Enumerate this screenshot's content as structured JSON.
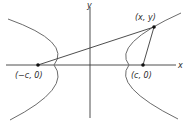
{
  "diagram": {
    "type": "hyperbola-foci",
    "axes": {
      "x_label": "x",
      "y_label": "y"
    },
    "points": {
      "left_focus": {
        "label": "(−c, 0)"
      },
      "right_focus": {
        "label": "(c, 0)"
      },
      "point_on_curve": {
        "label": "(x, y)"
      }
    },
    "colors": {
      "curve": "#6b6b6b",
      "axis": "#3a3a3a",
      "line": "#3a3a3a",
      "point": "#111111"
    }
  }
}
